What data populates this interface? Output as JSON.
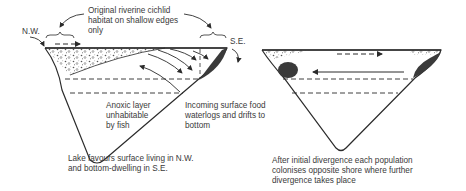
{
  "left_panel": {
    "label_nw": "N.W.",
    "label_se": "S.E.",
    "habitat_note": "Original riverine cichlid\nhabitat on shallow edges\nonly",
    "anoxic_note": "Anoxic layer\nunhabitable\nby fish",
    "food_note": "Incoming surface food\nwaterlogs and drifts to\nbottom",
    "caption": "Lake favours surface living in N.W.\nand bottom-dwelling in S.E."
  },
  "right_panel": {
    "caption": "After initial divergence each population\ncolonises opposite shore where further\ndivergence takes place"
  },
  "colors": {
    "ink": "#2b2b2b",
    "fill_dark": "#3a3a3a",
    "text": "#3a3a3a"
  }
}
